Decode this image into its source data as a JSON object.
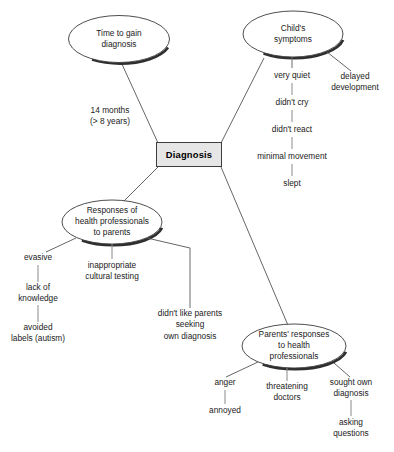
{
  "diagram": {
    "type": "mind-map",
    "center": {
      "label": "Diagnosis",
      "shape": "rectangle",
      "fill": "#e6e6e6",
      "border": "#3d3d3d"
    },
    "edge_labels": [
      {
        "name": "time-to-diagnosis-duration",
        "text": "14 months\n(> 8 years)"
      }
    ],
    "branches": [
      {
        "id": "time-to-gain-diagnosis",
        "label": "Time to gain\ndiagnosis",
        "shape": "ellipse",
        "children": []
      },
      {
        "id": "childs-symptoms",
        "label": "Child's\nsymptoms",
        "shape": "ellipse",
        "children": [
          {
            "id": "very-quiet",
            "label": "very quiet"
          },
          {
            "id": "didnt-cry",
            "label": "didn't cry"
          },
          {
            "id": "didnt-react",
            "label": "didn't react"
          },
          {
            "id": "minimal-movement",
            "label": "minimal movement"
          },
          {
            "id": "slept",
            "label": "slept"
          },
          {
            "id": "delayed-development",
            "label": "delayed\ndevelopment"
          }
        ]
      },
      {
        "id": "responses-of-health-professionals-to-parents",
        "label": "Responses of\nhealth professionals\nto parents",
        "shape": "ellipse",
        "children": [
          {
            "id": "evasive",
            "label": "evasive"
          },
          {
            "id": "lack-of-knowledge",
            "label": "lack of\nknowledge"
          },
          {
            "id": "avoided-labels-autism",
            "label": "avoided\nlabels (autism)"
          },
          {
            "id": "inappropriate-cultural-testing",
            "label": "inappropriate\ncultural testing"
          },
          {
            "id": "didnt-like-parents-seeking-own-diagnosis",
            "label": "didn't like parents\nseeking\nown diagnosis"
          }
        ]
      },
      {
        "id": "parents-responses-to-health-professionals",
        "label": "Parents' responses\nto health\nprofessionals",
        "shape": "ellipse",
        "children": [
          {
            "id": "anger",
            "label": "anger"
          },
          {
            "id": "annoyed",
            "label": "annoyed"
          },
          {
            "id": "threatening-doctors",
            "label": "threatening\ndoctors"
          },
          {
            "id": "sought-own-diagnosis",
            "label": "sought own\ndiagnosis"
          },
          {
            "id": "asking-questions",
            "label": "asking\nquestions"
          }
        ]
      }
    ],
    "colors": {
      "line": "#555555",
      "ellipse_stroke": "#3a3a3a",
      "text": "#1a1a1a",
      "background": "#ffffff"
    }
  }
}
